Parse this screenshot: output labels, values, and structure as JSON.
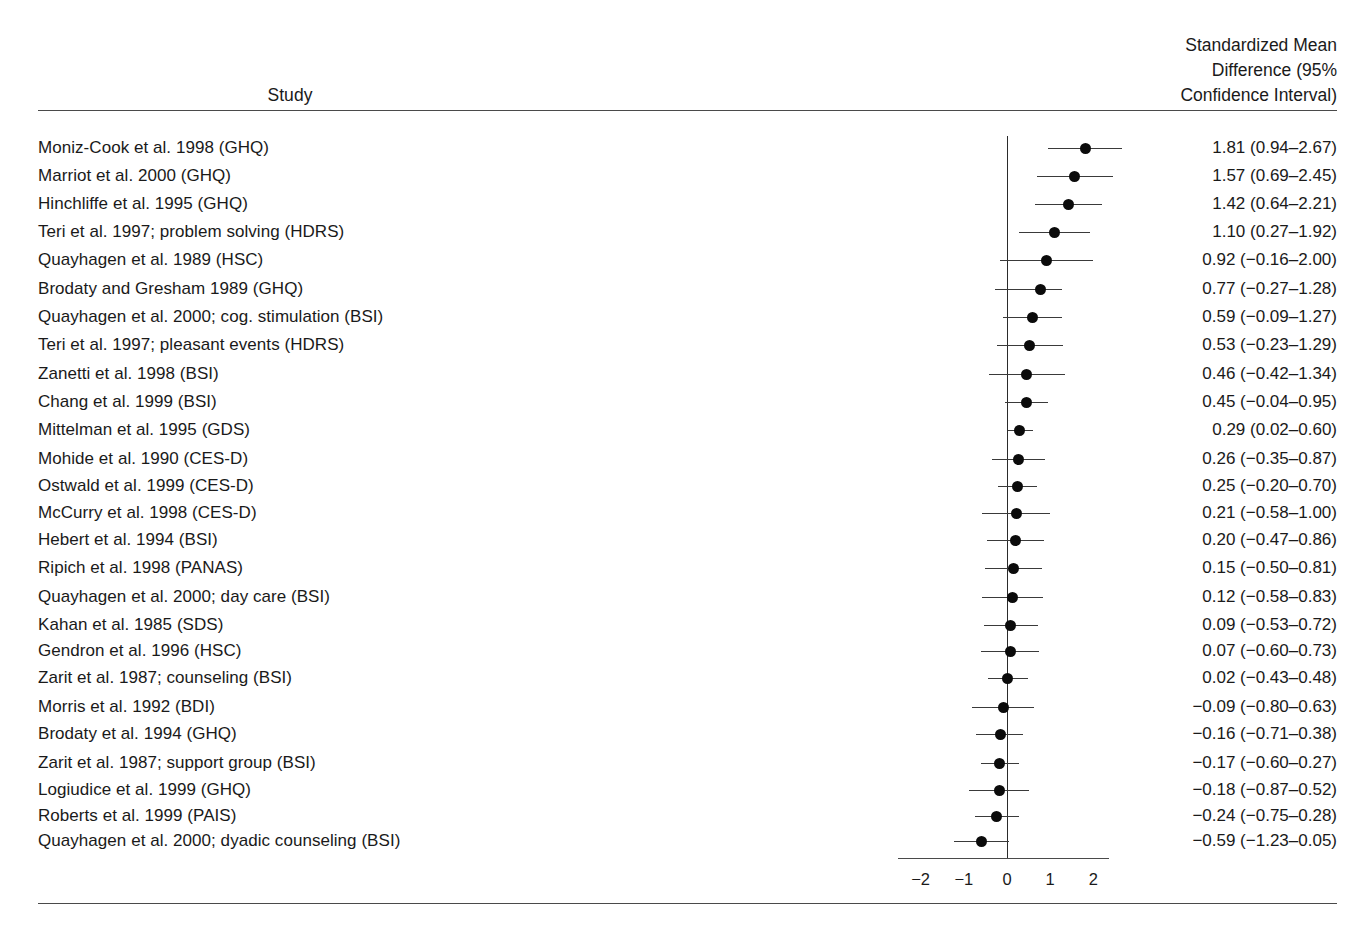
{
  "header": {
    "study_label": "Study",
    "effect_line1": "Standardized Mean",
    "effect_line2": "Difference (95%",
    "effect_line3": "Confidence Interval)"
  },
  "chart_data": {
    "type": "scatter",
    "subtype": "forest-plot",
    "title": "",
    "xlabel": "",
    "ylabel": "",
    "xlim": [
      -2.55,
      2.35
    ],
    "grid": false,
    "legend": null,
    "reference_line": 0,
    "xticks": [
      -2,
      -1,
      0,
      1,
      2
    ],
    "xtick_labels": [
      "−2",
      "−1",
      "0",
      "1",
      "2"
    ],
    "columns": [
      "Study",
      "Standardized Mean Difference (95% Confidence Interval)"
    ],
    "rows": [
      {
        "study": "Moniz-Cook et al. 1998 (GHQ)",
        "value": 1.81,
        "low": 0.94,
        "high": 2.67,
        "value_text": "1.81 (0.94–2.67)"
      },
      {
        "study": "Marriot et al. 2000 (GHQ)",
        "value": 1.57,
        "low": 0.69,
        "high": 2.45,
        "value_text": "1.57 (0.69–2.45)"
      },
      {
        "study": "Hinchliffe et al. 1995 (GHQ)",
        "value": 1.42,
        "low": 0.64,
        "high": 2.21,
        "value_text": "1.42 (0.64–2.21)"
      },
      {
        "study": "Teri et al. 1997; problem solving (HDRS)",
        "value": 1.1,
        "low": 0.27,
        "high": 1.92,
        "value_text": "1.10 (0.27–1.92)"
      },
      {
        "study": "Quayhagen et al. 1989 (HSC)",
        "value": 0.92,
        "low": -0.16,
        "high": 2.0,
        "value_text": "0.92 (−0.16–2.00)"
      },
      {
        "study": "Brodaty and Gresham 1989 (GHQ)",
        "value": 0.77,
        "low": -0.27,
        "high": 1.28,
        "value_text": "0.77 (−0.27–1.28)"
      },
      {
        "study": "Quayhagen et al. 2000; cog. stimulation (BSI)",
        "value": 0.59,
        "low": -0.09,
        "high": 1.27,
        "value_text": "0.59 (−0.09–1.27)"
      },
      {
        "study": "Teri et al. 1997; pleasant events (HDRS)",
        "value": 0.53,
        "low": -0.23,
        "high": 1.29,
        "value_text": "0.53 (−0.23–1.29)"
      },
      {
        "study": "Zanetti et al. 1998 (BSI)",
        "value": 0.46,
        "low": -0.42,
        "high": 1.34,
        "value_text": "0.46 (−0.42–1.34)"
      },
      {
        "study": "Chang et al. 1999 (BSI)",
        "value": 0.45,
        "low": -0.04,
        "high": 0.95,
        "value_text": "0.45 (−0.04–0.95)"
      },
      {
        "study": "Mittelman et al. 1995 (GDS)",
        "value": 0.29,
        "low": 0.02,
        "high": 0.6,
        "value_text": "0.29 (0.02–0.60)"
      },
      {
        "study": "Mohide et al. 1990 (CES-D)",
        "value": 0.26,
        "low": -0.35,
        "high": 0.87,
        "value_text": "0.26 (−0.35–0.87)"
      },
      {
        "study": "Ostwald et al. 1999 (CES-D)",
        "value": 0.25,
        "low": -0.2,
        "high": 0.7,
        "value_text": "0.25 (−0.20–0.70)"
      },
      {
        "study": "McCurry et al. 1998 (CES-D)",
        "value": 0.21,
        "low": -0.58,
        "high": 1.0,
        "value_text": "0.21 (−0.58–1.00)"
      },
      {
        "study": "Hebert et al. 1994 (BSI)",
        "value": 0.2,
        "low": -0.47,
        "high": 0.86,
        "value_text": "0.20 (−0.47–0.86)"
      },
      {
        "study": "Ripich et al. 1998 (PANAS)",
        "value": 0.15,
        "low": -0.5,
        "high": 0.81,
        "value_text": "0.15 (−0.50–0.81)"
      },
      {
        "study": "Quayhagen et al. 2000; day care (BSI)",
        "value": 0.12,
        "low": -0.58,
        "high": 0.83,
        "value_text": "0.12 (−0.58–0.83)"
      },
      {
        "study": "Kahan et al. 1985 (SDS)",
        "value": 0.09,
        "low": -0.53,
        "high": 0.72,
        "value_text": "0.09 (−0.53–0.72)"
      },
      {
        "study": "Gendron et al. 1996 (HSC)",
        "value": 0.07,
        "low": -0.6,
        "high": 0.73,
        "value_text": "0.07 (−0.60–0.73)"
      },
      {
        "study": "Zarit et al. 1987; counseling (BSI)",
        "value": 0.02,
        "low": -0.43,
        "high": 0.48,
        "value_text": "0.02 (−0.43–0.48)"
      },
      {
        "study": "Morris et al. 1992 (BDI)",
        "value": -0.09,
        "low": -0.8,
        "high": 0.63,
        "value_text": "−0.09 (−0.80–0.63)"
      },
      {
        "study": "Brodaty et al. 1994 (GHQ)",
        "value": -0.16,
        "low": -0.71,
        "high": 0.38,
        "value_text": "−0.16 (−0.71–0.38)"
      },
      {
        "study": "Zarit et al. 1987; support group (BSI)",
        "value": -0.17,
        "low": -0.6,
        "high": 0.27,
        "value_text": "−0.17 (−0.60–0.27)"
      },
      {
        "study": "Logiudice et al. 1999 (GHQ)",
        "value": -0.18,
        "low": -0.87,
        "high": 0.52,
        "value_text": "−0.18 (−0.87–0.52)"
      },
      {
        "study": "Roberts et al. 1999 (PAIS)",
        "value": -0.24,
        "low": -0.75,
        "high": 0.28,
        "value_text": "−0.24 (−0.75–0.28)"
      },
      {
        "study": "Quayhagen et al. 2000; dyadic counseling (BSI)",
        "value": -0.59,
        "low": -1.23,
        "high": 0.05,
        "value_text": "−0.59 (−1.23–0.05)"
      }
    ]
  },
  "geometry": {
    "row_tops": [
      137,
      165,
      193,
      221,
      249,
      278,
      306,
      334,
      363,
      391,
      419,
      448,
      475,
      502,
      529,
      557,
      586,
      614,
      640,
      667,
      696,
      723,
      752,
      779,
      805,
      830
    ],
    "x_zero_px": 1007,
    "px_per_unit": 43.2
  },
  "colors": {
    "background": "#ffffff",
    "text": "#1a1a1a",
    "rule": "#4a4a4a",
    "point": "#0b0b0b",
    "ci": "#3a3a3a"
  }
}
